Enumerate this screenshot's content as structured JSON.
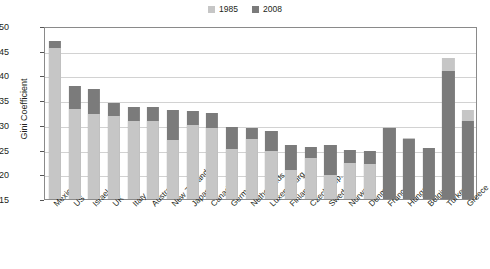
{
  "chart_data": {
    "type": "bar",
    "title": "",
    "xlabel": "",
    "ylabel": "Gini Coefficient",
    "ylim": [
      15,
      50
    ],
    "yticks": [
      15,
      20,
      25,
      30,
      35,
      40,
      45,
      50
    ],
    "grid": true,
    "legend_position": "top-center",
    "categories": [
      "Mexico",
      "US",
      "Israel",
      "UK",
      "Italy",
      "Australia",
      "New Zealand",
      "Japan",
      "Canada",
      "Germany",
      "Netherlands",
      "Luxembourg",
      "Finland",
      "Czech Rep.",
      "Sweden",
      "Norway",
      "Denmark",
      "France",
      "Hungary",
      "Belgium",
      "Turkey",
      "Greece"
    ],
    "series": [
      {
        "name": "1985",
        "color": "#c6c6c6",
        "values": [
          45.5,
          33.3,
          32.3,
          31.7,
          30.8,
          30.8,
          27.0,
          30.0,
          29.3,
          25.1,
          27.2,
          24.7,
          20.9,
          23.2,
          19.8,
          22.2,
          22.1,
          29.5,
          27.3,
          25.4,
          43.5,
          33.0
        ]
      },
      {
        "name": "2008",
        "color": "#7b7b7b",
        "values": [
          47.0,
          37.8,
          37.2,
          34.5,
          33.7,
          33.6,
          33.0,
          32.9,
          32.4,
          29.5,
          29.4,
          28.8,
          25.9,
          25.6,
          25.9,
          25.0,
          24.8,
          29.3,
          27.2,
          25.3,
          41.0,
          30.7
        ]
      }
    ]
  },
  "legend": {
    "items": [
      {
        "label": "1985",
        "color": "#c6c6c6"
      },
      {
        "label": "2008",
        "color": "#7b7b7b"
      }
    ]
  }
}
